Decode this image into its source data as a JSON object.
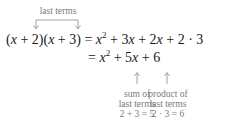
{
  "annotation_top": {
    "label": "last terms"
  },
  "equation": {
    "line1": {
      "lhs": "(x + 2)(x + 3)",
      "rhs": "= x² + 3x + 2x + 2 · 3"
    },
    "line2": {
      "rhs": "= x² + 5x + 6"
    }
  },
  "annotations_bottom": [
    {
      "line1": "sum of",
      "line2": "last terms",
      "line3": "2 + 3 = 5"
    },
    {
      "line1": "product of",
      "line2": "last terms",
      "line3": "2 · 3 = 6"
    }
  ],
  "colors": {
    "text": "#1a1a1a",
    "annotation": "#7a7a7a"
  }
}
